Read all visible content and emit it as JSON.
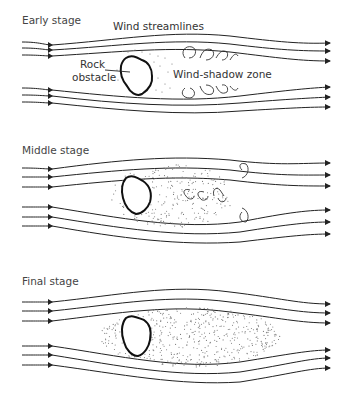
{
  "panels": [
    {
      "stage_label": "Early stage",
      "annotations": {
        "streamlines": "Wind streamlines",
        "obstacle": "Rock\nobstacle",
        "obstacle_line1": "Rock",
        "obstacle_line2": "obstacle",
        "zone": "Wind-shadow zone"
      },
      "eddies": 8,
      "sand": "small patch around rock"
    },
    {
      "stage_label": "Middle stage",
      "eddies": 4,
      "sand": "larger elongated patch"
    },
    {
      "stage_label": "Final stage",
      "eddies": 0,
      "sand": "long streamlined drift"
    }
  ],
  "colors": {
    "line": "#222222",
    "sand": "#777777",
    "background": "#ffffff"
  }
}
